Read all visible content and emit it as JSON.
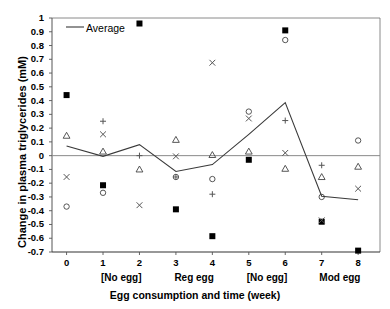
{
  "chart_data": {
    "type": "scatter",
    "title": "",
    "xlabel": "Egg consumption and time (week)",
    "ylabel": "Change in plasma triglycerides (mM)",
    "xlim": [
      -0.4,
      8.6
    ],
    "ylim": [
      -0.7,
      1.0
    ],
    "ytick_labels": [
      "1",
      "0.9",
      "0.8",
      "0.7",
      "0.6",
      "0.5",
      "0.4",
      "0.3",
      "0.2",
      "0.1",
      "0",
      "-0.1",
      "-0.2",
      "-0.3",
      "-0.4",
      "-0.5",
      "-0.6",
      "-0.7"
    ],
    "ytick_values": [
      1,
      0.9,
      0.8,
      0.7,
      0.6,
      0.5,
      0.4,
      0.3,
      0.2,
      0.1,
      0,
      -0.1,
      -0.2,
      -0.3,
      -0.4,
      -0.5,
      -0.6,
      -0.7
    ],
    "xtick_labels": [
      "0",
      "1",
      "2",
      "3",
      "4",
      "5",
      "6",
      "7",
      "8"
    ],
    "xtick_values": [
      0,
      1,
      2,
      3,
      4,
      5,
      6,
      7,
      8
    ],
    "grid": false,
    "zero_line": true,
    "group_labels": [
      {
        "text": "[No egg]",
        "center_x": 1.5
      },
      {
        "text": "Reg egg",
        "center_x": 3.5
      },
      {
        "text": "[No egg]",
        "center_x": 5.5
      },
      {
        "text": "Mod egg",
        "center_x": 7.5
      }
    ],
    "legend": {
      "position": "top-left-inside",
      "entries": [
        {
          "label": "Average",
          "marker": "line",
          "color": "#000000"
        }
      ]
    },
    "series": [
      {
        "name": "Subject A",
        "marker": "filled-square",
        "color": "#000000",
        "x": [
          0,
          1,
          2,
          3,
          4,
          5,
          6,
          7,
          8
        ],
        "values": [
          0.44,
          -0.215,
          0.96,
          -0.39,
          -0.585,
          -0.03,
          0.91,
          -0.48,
          -0.69
        ]
      },
      {
        "name": "Subject B",
        "marker": "open-circle",
        "color": "#000000",
        "x": [
          0,
          1,
          3,
          4,
          5,
          6,
          7,
          8
        ],
        "values": [
          -0.37,
          -0.27,
          -0.155,
          -0.17,
          0.32,
          0.84,
          -0.3,
          0.11
        ]
      },
      {
        "name": "Subject C",
        "marker": "open-triangle",
        "color": "#000000",
        "x": [
          0,
          1,
          2,
          3,
          4,
          5,
          6,
          7,
          8
        ],
        "values": [
          0.145,
          0.03,
          -0.1,
          0.115,
          0.005,
          0.03,
          -0.095,
          -0.155,
          -0.08
        ]
      },
      {
        "name": "Subject D",
        "marker": "cross-x",
        "color": "#000000",
        "x": [
          0,
          1,
          2,
          3,
          4,
          5,
          6,
          7,
          8
        ],
        "values": [
          -0.155,
          0.155,
          -0.36,
          -0.005,
          0.675,
          0.27,
          0.02,
          -0.47,
          -0.24
        ]
      },
      {
        "name": "Subject E",
        "marker": "plus",
        "color": "#000000",
        "x": [
          1,
          2,
          3,
          4,
          6,
          7
        ],
        "values": [
          0.25,
          0.0,
          -0.155,
          -0.28,
          0.255,
          -0.07
        ]
      }
    ],
    "average_line": {
      "name": "Average",
      "x": [
        0,
        1,
        2,
        3,
        4,
        5,
        6,
        7,
        8
      ],
      "values": [
        0.07,
        -0.005,
        0.08,
        -0.115,
        -0.065,
        0.155,
        0.385,
        -0.295,
        -0.32
      ]
    }
  }
}
